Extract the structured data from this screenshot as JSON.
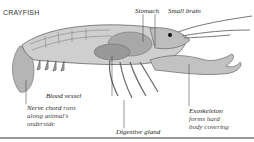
{
  "title": "CRAYFISH",
  "labels": {
    "stomach": "Stomach",
    "small_brain": "Small brain",
    "blood_vessel": "Blood vessel",
    "nerve_chord": {
      "term": "Nerve chord",
      "rest1": " runs",
      "line2": "along animal's",
      "line3": "underside"
    },
    "digestive_gland": "Digestive gland",
    "exoskeleton": {
      "term": "Exoskeleton",
      "line2": "forms hard",
      "line3": "body covering"
    }
  },
  "colors": {
    "body": "#c8c8c8",
    "organs": "#9a9a9a",
    "outline": "#555555",
    "leader": "#333333"
  }
}
